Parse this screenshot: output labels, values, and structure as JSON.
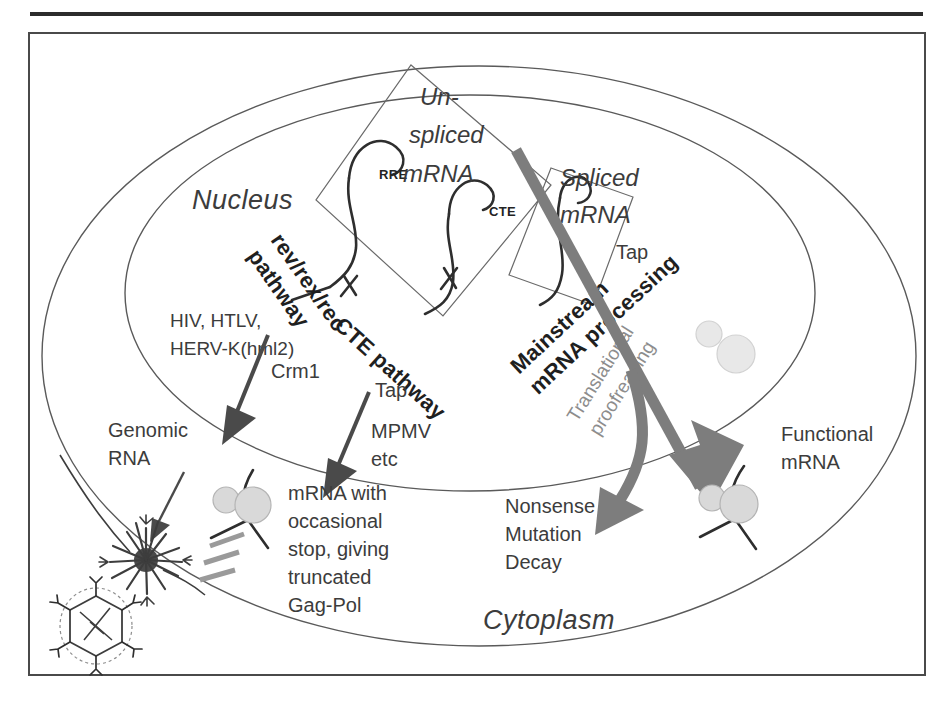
{
  "figure": {
    "compartments": {
      "nucleus": "Nucleus",
      "cytoplasm": "Cytoplasm"
    },
    "rna_boxes": {
      "unspliced_line1": "Un-",
      "unspliced_line2": "spliced",
      "unspliced_line3": "mRNA",
      "spliced_line1": "Spliced",
      "spliced_line2": "mRNA",
      "rre_label": "RRE",
      "cte_label": "CTE"
    },
    "pathways": {
      "rev_line1": "rev/rex/rec",
      "rev_line2": "pathway",
      "cte": "CTE pathway",
      "mainstream_line1": "Mainstream",
      "mainstream_line2": "mRNA processing",
      "translational_line1": "Translational",
      "translational_line2": "proofreading"
    },
    "annotations": {
      "virus_families_line1": "HIV, HTLV,",
      "virus_families_line2": "HERV-K(hml2)",
      "crm1": "Crm1",
      "tap_left": "Tap",
      "tap_right": "Tap",
      "mpmv_line1": "MPMV",
      "mpmv_line2": "etc",
      "genomic_rna_line1": "Genomic",
      "genomic_rna_line2": "RNA",
      "truncated_line1": "mRNA with",
      "truncated_line2": "occasional",
      "truncated_line3": "stop, giving",
      "truncated_line4": "truncated",
      "truncated_line5": "Gag-Pol",
      "nmd_line1": "Nonsense",
      "nmd_line2": "Mutation",
      "nmd_line3": "Decay",
      "functional_line1": "Functional",
      "functional_line2": "mRNA"
    },
    "colors": {
      "ink": "#3c3c3c",
      "band_gray": "#7d7d7d",
      "arrow_dark": "#4a4a4a",
      "ribosome": "#d9d9d9",
      "ribosome_faint": "#e8e8e8",
      "membrane": "#5a5a5a",
      "frame": "#4a4a4a"
    }
  }
}
